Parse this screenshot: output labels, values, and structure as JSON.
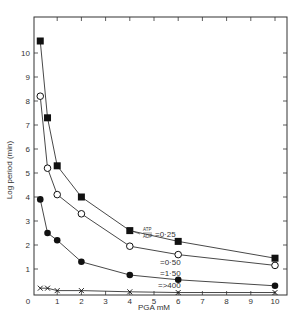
{
  "chart_data": {
    "type": "line",
    "title": "",
    "xlabel": "PGA mM",
    "ylabel": "Log period (min)",
    "xlim": [
      0,
      10
    ],
    "ylim": [
      0,
      11
    ],
    "x_ticks": [
      0,
      1,
      2,
      3,
      4,
      5,
      6,
      7,
      8,
      9,
      10
    ],
    "y_ticks": [
      1,
      2,
      3,
      4,
      5,
      6,
      7,
      8,
      9,
      10
    ],
    "grid": false,
    "legend_position": "inline annotations near x=4-6",
    "annotation_ratio_label": "ATP/ADP",
    "series": [
      {
        "name": "=0·25",
        "marker": "filled-square",
        "x": [
          0.3,
          0.6,
          1,
          2,
          4,
          6,
          10
        ],
        "values": [
          10.5,
          7.3,
          5.3,
          4.0,
          2.6,
          2.15,
          1.45
        ]
      },
      {
        "name": "=0·50",
        "marker": "open-circle",
        "x": [
          0.3,
          0.6,
          1,
          2,
          4,
          6,
          10
        ],
        "values": [
          8.2,
          5.2,
          4.1,
          3.3,
          1.95,
          1.6,
          1.15
        ]
      },
      {
        "name": "=1·50",
        "marker": "filled-circle",
        "x": [
          0.3,
          0.6,
          1,
          2,
          4,
          6,
          10
        ],
        "values": [
          3.9,
          2.5,
          2.2,
          1.3,
          0.75,
          0.55,
          0.3
        ]
      },
      {
        "name": "=>400",
        "marker": "cross",
        "x": [
          0.3,
          0.6,
          1,
          2,
          4,
          6,
          10
        ],
        "values": [
          0.2,
          0.2,
          0.1,
          0.1,
          0.05,
          0.02,
          0.02
        ]
      }
    ]
  }
}
